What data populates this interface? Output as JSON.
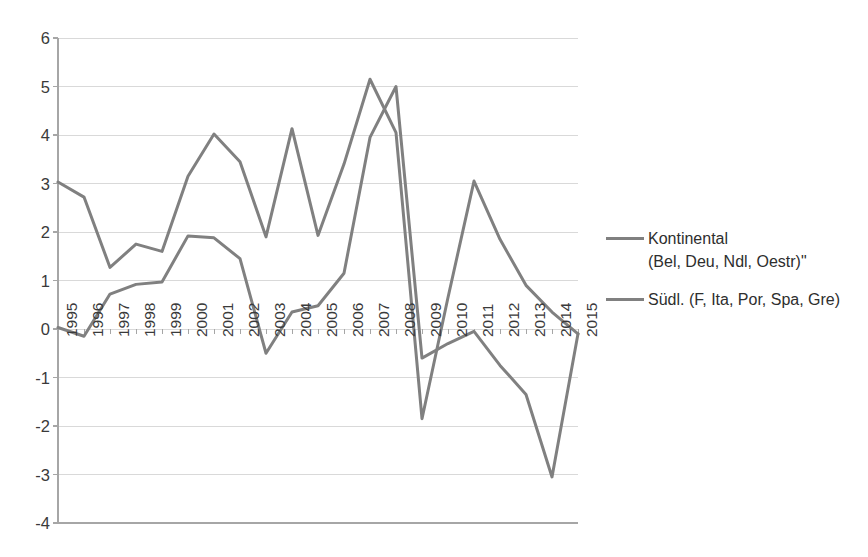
{
  "chart_data": {
    "type": "line",
    "title": "",
    "subtitle": "",
    "xlabel": "",
    "ylabel": "",
    "grid": true,
    "legend_position": "right",
    "ylim": [
      -4,
      6
    ],
    "ytick_step": 1,
    "ytick_labels": [
      "6",
      "5",
      "4",
      "3",
      "2",
      "1",
      "0",
      "-1",
      "-2",
      "-3",
      "-4"
    ],
    "ytick_values": [
      6,
      5,
      4,
      3,
      2,
      1,
      0,
      -1,
      -2,
      -3,
      -4
    ],
    "categories": [
      "1995",
      "1996",
      "1997",
      "1998",
      "1999",
      "2000",
      "2001",
      "2002",
      "2003",
      "2004",
      "2005",
      "2006",
      "2007",
      "2008",
      "2009",
      "2010",
      "2011",
      "2012",
      "2013",
      "2014",
      "2015"
    ],
    "series": [
      {
        "name": "Kontinental\n(Bel, Deu, Ndl, Oestr)\"",
        "legend_label": "Kontinental\n(Bel, Deu, Ndl, Oestr)\"",
        "color": "#808080",
        "values": [
          0.03,
          -0.15,
          0.72,
          0.92,
          0.97,
          1.92,
          1.88,
          1.45,
          -0.5,
          0.35,
          0.48,
          1.15,
          3.95,
          5.0,
          -0.6,
          -0.3,
          -0.05,
          -0.75,
          -1.35,
          -3.05,
          -0.1
        ]
      },
      {
        "name": "Südl. (F, Ita, Por, Spa, Gre)",
        "legend_label": "Südl. (F, Ita, Por, Spa, Gre)",
        "color": "#808080",
        "values": [
          3.03,
          2.72,
          1.27,
          1.75,
          1.6,
          3.15,
          4.02,
          3.45,
          1.9,
          4.13,
          1.93,
          3.4,
          5.15,
          4.05,
          -1.85,
          0.65,
          3.05,
          1.85,
          0.9,
          0.35,
          -0.1
        ]
      }
    ],
    "colors": {
      "series_line": "#808080",
      "grid_line": "#d9d9d9",
      "axis_line": "#a6a6a6",
      "tick_text": "#3a3a3a",
      "legend_text": "#2e2e2e",
      "background": "#ffffff"
    },
    "axis": {
      "y_axis_visible": true,
      "x_axis_visible": true,
      "x_axis_at_value": -4,
      "tick_marks_at_zero": true
    }
  }
}
